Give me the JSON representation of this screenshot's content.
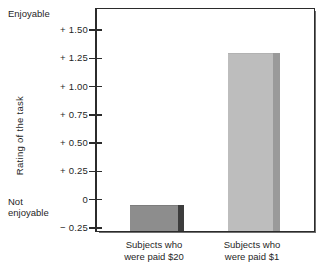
{
  "chart_data": {
    "type": "bar",
    "title": "",
    "xlabel": "",
    "ylabel": "Rating of the task",
    "categories": [
      "Subjects who\nwere paid $20",
      "Subjects who\nwere paid $1"
    ],
    "values": [
      -0.05,
      1.3
    ],
    "ylim": [
      -0.3125,
      1.625
    ],
    "yticks": [
      1.5,
      1.25,
      1.0,
      0.75,
      0.5,
      0.25,
      0.0,
      -0.25
    ],
    "ytick_labels": [
      "+ 1.50",
      "+ 1.25",
      "+ 1.00",
      "+ 0.75",
      "+ 0.50",
      "+ 0.25",
      "0",
      "− 0.25"
    ],
    "grid": false,
    "legend": null,
    "axis_anchor_high": "Enjoyable",
    "axis_anchor_low": "Not\nenjoyable",
    "series": [
      {
        "name": "Rating of the task",
        "values": [
          -0.05,
          1.3
        ]
      }
    ],
    "colors": {
      "bar_dark_face": "#8d8d8d",
      "bar_dark_side": "#3d3d3d",
      "bar_light_face": "#bdbdbd",
      "bar_light_side": "#9a9a9a",
      "axis": "#2b2b2b",
      "frame": "#2b2b2b",
      "background": "#ffffff",
      "text": "#1f1f1f"
    }
  },
  "axis": {
    "y_title": "Rating of the task",
    "anchor_top": "Enjoyable",
    "anchor_bottom": "Not\nenjoyable",
    "ticks": [
      {
        "label": "+ 1.50",
        "value": 1.5
      },
      {
        "label": "+ 1.25",
        "value": 1.25
      },
      {
        "label": "+ 1.00",
        "value": 1.0
      },
      {
        "label": "+ 0.75",
        "value": 0.75
      },
      {
        "label": "+ 0.50",
        "value": 0.5
      },
      {
        "label": "+ 0.25",
        "value": 0.25
      },
      {
        "label": "0",
        "value": 0.0
      },
      {
        "label": "− 0.25",
        "value": -0.25
      }
    ]
  },
  "bars": [
    {
      "label": "Subjects who\nwere paid $20",
      "value": -0.05,
      "style": "dark"
    },
    {
      "label": "Subjects who\nwere paid $1",
      "value": 1.3,
      "style": "light"
    }
  ]
}
